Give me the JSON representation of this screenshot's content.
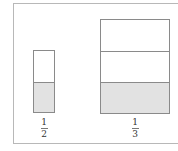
{
  "diagram": {
    "type": "fraction-bar-model",
    "colors": {
      "shaded": "#e2e2e2",
      "border": "#8a8a8a",
      "frame": "#b8b8b8"
    },
    "bars": [
      {
        "name": "half",
        "parts": 2,
        "shaded_parts": 1,
        "label": {
          "numerator": "1",
          "denominator": "2"
        }
      },
      {
        "name": "third",
        "parts": 3,
        "shaded_parts": 1,
        "label": {
          "numerator": "1",
          "denominator": "3"
        }
      }
    ]
  }
}
